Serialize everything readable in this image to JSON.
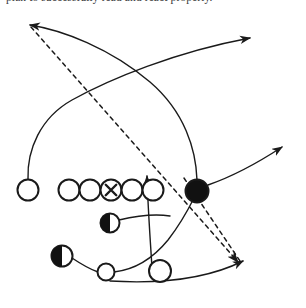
{
  "figure": {
    "kind": "american-football-play-diagram",
    "caption_partial": "plan to successfully read and react properly."
  },
  "colors": {
    "ink": "#1a1a1a",
    "paper": "#ffffff",
    "fill": "#111111"
  },
  "players": [
    {
      "id": "lineman-split-left",
      "label": "",
      "marker": "open-circle",
      "cx": 28,
      "cy": 190,
      "r": 10.5
    },
    {
      "id": "lineman-1",
      "label": "",
      "marker": "open-circle",
      "cx": 69,
      "cy": 190,
      "r": 10.5
    },
    {
      "id": "lineman-2",
      "label": "",
      "marker": "open-circle",
      "cx": 90,
      "cy": 190,
      "r": 10.5
    },
    {
      "id": "center-x",
      "label": "X",
      "marker": "x-circle",
      "cx": 111,
      "cy": 190,
      "r": 10.5
    },
    {
      "id": "lineman-3",
      "label": "",
      "marker": "open-circle",
      "cx": 132,
      "cy": 190,
      "r": 10.5
    },
    {
      "id": "lineman-4",
      "label": "",
      "marker": "open-circle",
      "cx": 153,
      "cy": 190,
      "r": 10.5
    },
    {
      "id": "end-filled",
      "label": "",
      "marker": "filled-circle",
      "cx": 197,
      "cy": 191,
      "r": 11.5
    },
    {
      "id": "back-half-left",
      "label": "",
      "marker": "half-circle",
      "cx": 62,
      "cy": 256,
      "r": 10.5
    },
    {
      "id": "back-half-mid",
      "label": "",
      "marker": "half-circle",
      "cx": 110,
      "cy": 223,
      "r": 9.5
    },
    {
      "id": "back-open-low",
      "label": "",
      "marker": "open-circle",
      "cx": 106,
      "cy": 272,
      "r": 8.5
    },
    {
      "id": "back-open-right",
      "label": "",
      "marker": "open-circle",
      "cx": 160,
      "cy": 271,
      "r": 11.0
    }
  ],
  "routes": [
    {
      "id": "route-left-sweep",
      "style": "solid",
      "arrow": true,
      "d": "M 28 179 C 27 150, 40 118, 72 100 C 110 79, 175 52, 250 38"
    },
    {
      "id": "route-deep-cross",
      "style": "solid",
      "arrow": true,
      "d": "M 197 180 C 196 150, 185 112, 150 82 C 110 48, 62 30, 30 25"
    },
    {
      "id": "route-flat-right",
      "style": "solid",
      "arrow": true,
      "d": "M 208 185 C 228 178, 250 168, 282 147"
    },
    {
      "id": "route-dash-long",
      "style": "dashed",
      "arrow": true,
      "d": "M 31 27 L 238 262"
    },
    {
      "id": "route-dash-short",
      "style": "dashed",
      "arrow": false,
      "d": "M 184 178 L 240 261"
    },
    {
      "id": "route-stem-up",
      "style": "solid",
      "arrow": true,
      "d": "M 152 268 C 150 235, 148 210, 147 176"
    },
    {
      "id": "route-back-connect",
      "style": "solid",
      "arrow": false,
      "d": "M 72 258 C 84 266, 95 271, 98 272"
    },
    {
      "id": "route-back-arc",
      "style": "solid",
      "arrow": false,
      "d": "M 114 272 C 132 270, 150 262, 168 240 C 182 222, 190 206, 194 198"
    },
    {
      "id": "route-half-mid-tail",
      "style": "solid",
      "arrow": false,
      "d": "M 119 220 C 140 215, 158 214, 170 216"
    },
    {
      "id": "route-bottom-swing",
      "style": "solid",
      "arrow": true,
      "d": "M 110 281 C 160 284, 205 280, 243 261"
    }
  ],
  "annotations": {
    "center_mark": "X"
  }
}
